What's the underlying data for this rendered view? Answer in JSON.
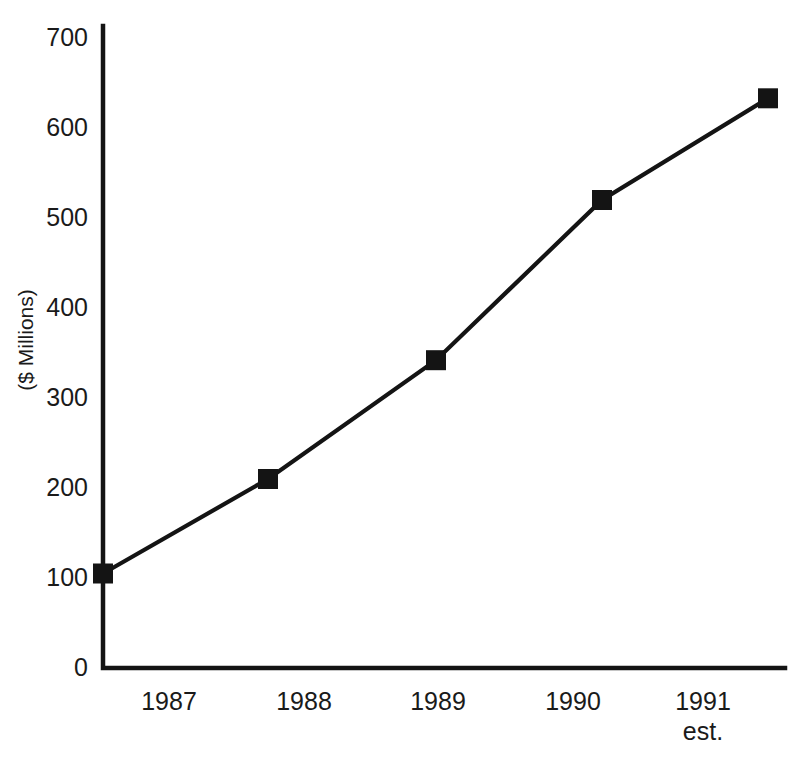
{
  "chart_data": {
    "type": "line",
    "title": "",
    "subtitle": "",
    "xlabel": "",
    "ylabel": "($ Millions)",
    "categories": [
      "1987",
      "1988",
      "1989",
      "1990",
      "1991 est."
    ],
    "x_tick_labels": [
      "1987",
      "1988",
      "1989",
      "1990",
      "1991"
    ],
    "x_tick_sublabels": [
      "",
      "",
      "",
      "",
      "est."
    ],
    "y_tick_labels": [
      "0",
      "100",
      "200",
      "300",
      "400",
      "500",
      "600",
      "700"
    ],
    "y_tick_values": [
      0,
      100,
      200,
      300,
      400,
      500,
      600,
      700
    ],
    "ylim": [
      0,
      700
    ],
    "grid": false,
    "legend": false,
    "legend_position": "none",
    "marker": "filled-square",
    "series": [
      {
        "name": "Revenue",
        "values": [
          105,
          210,
          342,
          520,
          633
        ]
      }
    ],
    "colors": {
      "line": "#141414",
      "marker": "#141414",
      "axis": "#141414",
      "background": "#ffffff",
      "text": "#1a1a1a"
    },
    "annotations": []
  },
  "layout": {
    "plot_left_px": 103,
    "plot_baseline_px": 668,
    "plot_right_px": 785,
    "plot_top_px": 30,
    "y_unit_px": 0.9,
    "point_x_px": [
      103,
      268,
      436,
      602,
      768
    ],
    "x_label_center_px": [
      169,
      304,
      438,
      573,
      703
    ],
    "y_label_x_px": 88,
    "x_label_y_px": 692,
    "x_sublabel_y_px": 722,
    "axis_title_x_px": 33,
    "axis_title_y_px": 340,
    "marker_size_px": 20
  }
}
